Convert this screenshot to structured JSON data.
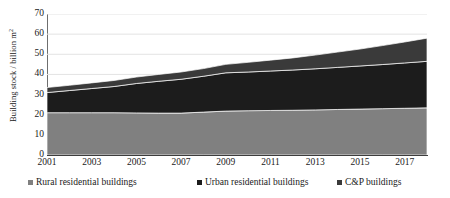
{
  "chart_data": {
    "type": "area",
    "stacked": true,
    "title": "",
    "xlabel": "",
    "ylabel": "Building stock / billion m²",
    "ylim": [
      0,
      70
    ],
    "ytick_step": 10,
    "yticks": [
      "0",
      "10",
      "20",
      "30",
      "40",
      "50",
      "60",
      "70"
    ],
    "xlim": [
      2001,
      2018
    ],
    "xticks": [
      "2001",
      "2003",
      "2005",
      "2007",
      "2009",
      "2011",
      "2013",
      "2015",
      "2017"
    ],
    "grid": "horizontal",
    "legend_position": "bottom",
    "x": [
      2001,
      2002,
      2003,
      2004,
      2005,
      2006,
      2007,
      2008,
      2009,
      2010,
      2011,
      2012,
      2013,
      2014,
      2015,
      2016,
      2017,
      2018
    ],
    "series": [
      {
        "name": "Rural residential buildings",
        "color": "#808080",
        "values": [
          21.0,
          21.0,
          21.0,
          21.0,
          20.9,
          20.8,
          20.8,
          21.3,
          21.8,
          22.0,
          22.1,
          22.2,
          22.4,
          22.6,
          22.8,
          23.0,
          23.2,
          23.4
        ]
      },
      {
        "name": "Urban residential buildings",
        "color": "#1c1c1c",
        "values": [
          10.0,
          11.0,
          12.0,
          13.0,
          14.6,
          15.8,
          16.8,
          17.8,
          19.0,
          19.2,
          19.6,
          20.0,
          20.4,
          20.9,
          21.4,
          21.9,
          22.5,
          23.1
        ]
      },
      {
        "name": "C&P buildings",
        "color": "#3a3a3a",
        "values": [
          2.5,
          2.6,
          2.8,
          3.0,
          3.2,
          3.4,
          3.6,
          3.8,
          4.2,
          4.8,
          5.4,
          6.0,
          6.8,
          7.6,
          8.4,
          9.4,
          10.4,
          11.5
        ]
      }
    ],
    "totals": [
      33.5,
      34.6,
      35.8,
      37.0,
      38.7,
      40.0,
      41.2,
      42.9,
      45.0,
      46.0,
      47.1,
      48.2,
      49.6,
      51.1,
      52.6,
      54.3,
      56.1,
      58.0
    ]
  },
  "legend": {
    "items": [
      {
        "label": "Rural residential buildings",
        "color": "#808080"
      },
      {
        "label": "Urban residential buildings",
        "color": "#1c1c1c"
      },
      {
        "label": "C&P buildings",
        "color": "#3a3a3a"
      }
    ]
  }
}
